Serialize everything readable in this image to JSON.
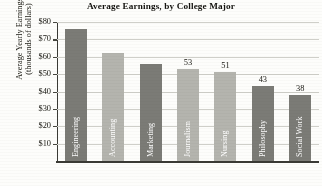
{
  "chart_data": {
    "type": "bar",
    "title": "Average Earnings, by College Major",
    "xlabel": "",
    "ylabel_line1": "Average Yearly Earnings",
    "ylabel_line2": "(thousands of dollars)",
    "categories": [
      "Engineering",
      "Accounting",
      "Marketing",
      "Journalism",
      "Nursing",
      "Philosophy",
      "Social Work"
    ],
    "values": [
      76,
      62,
      56,
      53,
      51,
      43,
      38
    ],
    "value_labels": [
      "",
      "",
      "",
      "53",
      "51",
      "43",
      "38"
    ],
    "bar_shades": [
      "dark",
      "light",
      "dark",
      "light",
      "light",
      "dark",
      "dark"
    ],
    "ylim": [
      0,
      80
    ],
    "ytick_labels": [
      "$80",
      "$70",
      "$60",
      "$50",
      "$40",
      "$30",
      "$20",
      "$10"
    ],
    "ytick_values": [
      80,
      70,
      60,
      50,
      40,
      30,
      20,
      10
    ],
    "grid": true,
    "legend": "none",
    "colors": {
      "bar_dark": "#7b7b76",
      "bar_light": "#b4b4ae",
      "axis": "#3a3a35",
      "gridline": "#cfcfc9",
      "text": "#16150f",
      "background": "#fdfdfb"
    }
  }
}
